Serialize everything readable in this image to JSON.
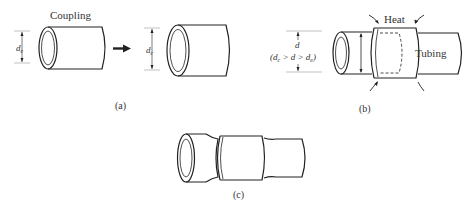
{
  "figure": {
    "panels": [
      {
        "id": "a",
        "caption": "(a)",
        "label_coupling": "Coupling",
        "dim_before": "d",
        "dim_before_sub": "e",
        "dim_after": "d",
        "dim_after_sub": "c"
      },
      {
        "id": "b",
        "caption": "(b)",
        "label_heat": "Heat",
        "label_tubing": "Tubing",
        "dim": "d",
        "inequality_open": "(d",
        "inequality_sub1": "c",
        "inequality_mid": " > d > d",
        "inequality_sub2": "e",
        "inequality_close": ")"
      },
      {
        "id": "c",
        "caption": "(c)"
      }
    ]
  }
}
